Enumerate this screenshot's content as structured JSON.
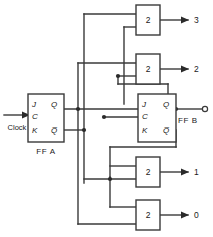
{
  "diagram": {
    "line_color": "#3a3a3a",
    "text_color": "#1a1a1a",
    "background": "#ffffff"
  },
  "clock": {
    "label": "Clock",
    "icon": "arrow-right-icon"
  },
  "flipflops": [
    {
      "id": "ffa",
      "name": "FF A",
      "pins": {
        "j": "J",
        "c": "C",
        "k": "K",
        "q": "Q",
        "qbar": "Q̅"
      }
    },
    {
      "id": "ffb",
      "name": "FF B",
      "pins": {
        "j": "J",
        "c": "C",
        "k": "K",
        "q": "Q",
        "qbar": "Q̅"
      }
    }
  ],
  "gates": [
    {
      "id": "gate-3",
      "label": "2",
      "output": "3"
    },
    {
      "id": "gate-2",
      "label": "2",
      "output": "2"
    },
    {
      "id": "gate-1",
      "label": "2",
      "output": "1"
    },
    {
      "id": "gate-0",
      "label": "2",
      "output": "0"
    }
  ],
  "outputs": [
    {
      "label": "3"
    },
    {
      "label": "2"
    },
    {
      "label": "1"
    },
    {
      "label": "0"
    }
  ],
  "terminals": [
    {
      "id": "ffb-q-terminal",
      "shape": "open-circle"
    }
  ]
}
